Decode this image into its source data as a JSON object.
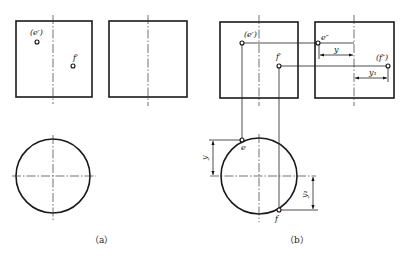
{
  "figure": {
    "panels": [
      {
        "caption": "（a）",
        "points": [
          {
            "label": "(e′)",
            "view": "front"
          },
          {
            "label": "f′",
            "view": "front"
          }
        ]
      },
      {
        "caption": "（b）",
        "points": [
          {
            "label": "(e′)",
            "view": "front"
          },
          {
            "label": "f′",
            "view": "front"
          },
          {
            "label": "e″",
            "view": "side"
          },
          {
            "label": "(f″)",
            "view": "side"
          },
          {
            "label": "e",
            "view": "top"
          },
          {
            "label": "f",
            "view": "top"
          }
        ],
        "dimensions": [
          {
            "label": "y"
          },
          {
            "label": "y₁"
          },
          {
            "label": "y",
            "view": "top"
          },
          {
            "label": "y₁",
            "view": "top"
          }
        ]
      }
    ],
    "colors": {
      "line": "#1a1a1a",
      "background": "#ffffff"
    }
  }
}
